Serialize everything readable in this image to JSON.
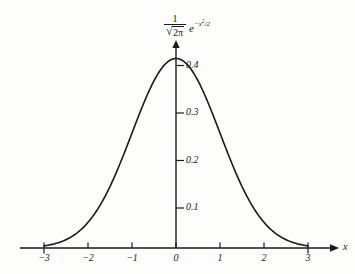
{
  "figure": {
    "background_color": "#fdfdfc",
    "ink_color": "#1a1a1a",
    "axis_x_label": "x"
  },
  "formula": {
    "numerator": "1",
    "sqrt_symbol": "√",
    "denominator_radicand": "2π",
    "exp_base": "e",
    "exp_superscript": "−x",
    "exp_superscript_power": "2",
    "exp_superscript_tail": "/2",
    "plain_text": "1/√(2π) e^(−x²/2)"
  },
  "chart_data": {
    "type": "line",
    "xlabel": "x",
    "ylabel": "",
    "xlim": [
      -3.2,
      3.2
    ],
    "ylim": [
      0,
      0.435
    ],
    "grid": false,
    "legend": null,
    "x_ticks": [
      -3,
      -2,
      -1,
      0,
      1,
      2,
      3
    ],
    "x_tick_labels": [
      "−3",
      "−2",
      "−1",
      "0",
      "1",
      "2",
      "3"
    ],
    "y_ticks": [
      0.1,
      0.2,
      0.3,
      0.4
    ],
    "y_tick_labels": [
      "0.1",
      "0.2",
      "0.3",
      "0.4"
    ],
    "series": [
      {
        "name": "standard normal density",
        "x": [
          -3.0,
          -2.8,
          -2.6,
          -2.4,
          -2.2,
          -2.0,
          -1.8,
          -1.6,
          -1.4,
          -1.2,
          -1.0,
          -0.8,
          -0.6,
          -0.4,
          -0.2,
          0.0,
          0.2,
          0.4,
          0.6,
          0.8,
          1.0,
          1.2,
          1.4,
          1.6,
          1.8,
          2.0,
          2.2,
          2.4,
          2.6,
          2.8,
          3.0
        ],
        "values": [
          0.0044,
          0.0079,
          0.0136,
          0.0224,
          0.0355,
          0.054,
          0.079,
          0.1109,
          0.1497,
          0.1942,
          0.242,
          0.2897,
          0.3332,
          0.3683,
          0.391,
          0.3989,
          0.391,
          0.3683,
          0.3332,
          0.2897,
          0.242,
          0.1942,
          0.1497,
          0.1109,
          0.079,
          0.054,
          0.0355,
          0.0224,
          0.0136,
          0.0079,
          0.0044
        ]
      }
    ],
    "peak": {
      "x": 0,
      "y": 0.3989
    }
  },
  "geometry": {
    "origin_px": {
      "x": 176,
      "y": 248
    },
    "x_unit_px": 44,
    "y_unit_px_per_0p1": 47.5,
    "x_axis_start_px": 20,
    "x_axis_end_px": 332,
    "y_axis_top_px": 42
  }
}
